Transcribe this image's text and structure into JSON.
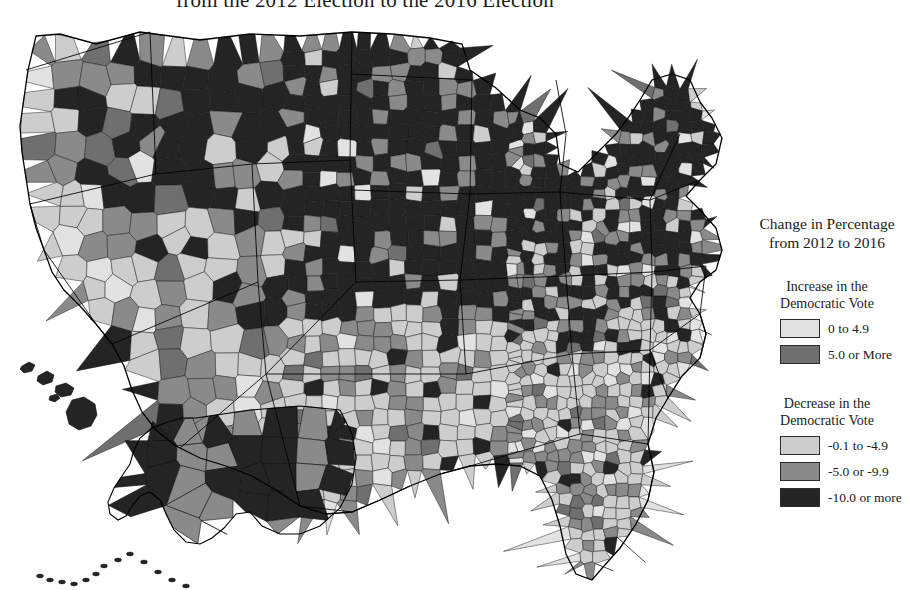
{
  "title": "from the 2012 Election to the 2016 Election",
  "legend": {
    "heading_line1": "Change in Percentage",
    "heading_line2": "from 2012 to 2016",
    "increase": {
      "head_line1": "Increase in the",
      "head_line2": "Democratic Vote",
      "items": [
        {
          "label": "0 to 4.9",
          "color": "#e2e2e2"
        },
        {
          "label": "5.0 or More",
          "color": "#6f6f6f"
        }
      ]
    },
    "decrease": {
      "head_line1": "Decrease in the",
      "head_line2": "Democratic Vote",
      "items": [
        {
          "label": "-0.1 to -4.9",
          "color": "#cdcdcd"
        },
        {
          "label": "-5.0 or -9.9",
          "color": "#8a8a8a"
        },
        {
          "label": "-10.0 or more",
          "color": "#242424"
        }
      ]
    }
  },
  "chart_data": {
    "type": "choropleth-map",
    "title": "from the 2012 Election to the 2016 Election",
    "region": "United States, county level, with Alaska and Hawaii insets",
    "variable": "Change in Democratic vote percentage from 2012 to 2016",
    "units": "percentage points",
    "palette": "grayscale, 5 classes",
    "classes": [
      {
        "label": "0 to 4.9",
        "direction": "Increase in the Democratic Vote",
        "color": "#e2e2e2",
        "min": 0.0,
        "max": 4.9
      },
      {
        "label": "5.0 or More",
        "direction": "Increase in the Democratic Vote",
        "color": "#6f6f6f",
        "min": 5.0,
        "max": null
      },
      {
        "label": "-0.1 to -4.9",
        "direction": "Decrease in the Democratic Vote",
        "color": "#cdcdcd",
        "min": -4.9,
        "max": -0.1
      },
      {
        "label": "-5.0 or -9.9",
        "direction": "Decrease in the Democratic Vote",
        "color": "#8a8a8a",
        "min": -9.9,
        "max": -5.0
      },
      {
        "label": "-10.0 or more",
        "direction": "Decrease in the Democratic Vote",
        "color": "#242424",
        "min": null,
        "max": -10.0
      }
    ],
    "regional_pattern": [
      {
        "region": "Upper Midwest (Iowa, Wisconsin, Minnesota, Michigan)",
        "dominant_class": "-10.0 or more"
      },
      {
        "region": "Northeast (Maine, New Hampshire, Vermont, New York, Pennsylvania, Ohio)",
        "dominant_class": "-10.0 or more"
      },
      {
        "region": "Northern Plains (Dakotas, Montana, Nebraska)",
        "dominant_class": "-10.0 or more"
      },
      {
        "region": "Southeast (Georgia, Carolinas, Alabama, Florida)",
        "dominant_class": "-0.1 to -4.9"
      },
      {
        "region": "Texas and the Southwest",
        "dominant_class": "-0.1 to -4.9"
      },
      {
        "region": "California coast and Pacific Northwest",
        "dominant_class": "-0.1 to -4.9"
      },
      {
        "region": "Alaska",
        "dominant_class": "-10.0 or more"
      },
      {
        "region": "Hawaii",
        "dominant_class": "-10.0 or more"
      }
    ]
  }
}
